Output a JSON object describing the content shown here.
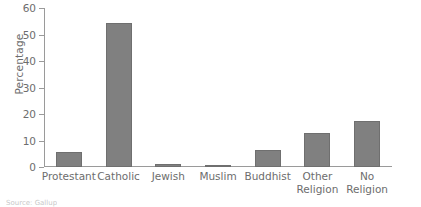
{
  "chart_data": {
    "type": "bar",
    "title": "",
    "xlabel": "",
    "ylabel": "Percentage",
    "ylim": [
      0,
      60
    ],
    "yticks": [
      0,
      10,
      20,
      30,
      40,
      50,
      60
    ],
    "grid": false,
    "legend": "none",
    "bar_color": "#808080",
    "bar_edge_color": "#6f6f6f",
    "axis_color": "#9a9a9a",
    "text_color": "#6d6d6d",
    "categories": [
      "Protestant",
      "Catholic",
      "Jewish",
      "Muslim",
      "Buddhist",
      "Other\nReligion",
      "No\nReligion"
    ],
    "values": [
      5.7,
      54.3,
      1.1,
      0.6,
      6.4,
      12.8,
      17.4
    ]
  },
  "footer": {
    "caption": "Source:  Gallup"
  }
}
